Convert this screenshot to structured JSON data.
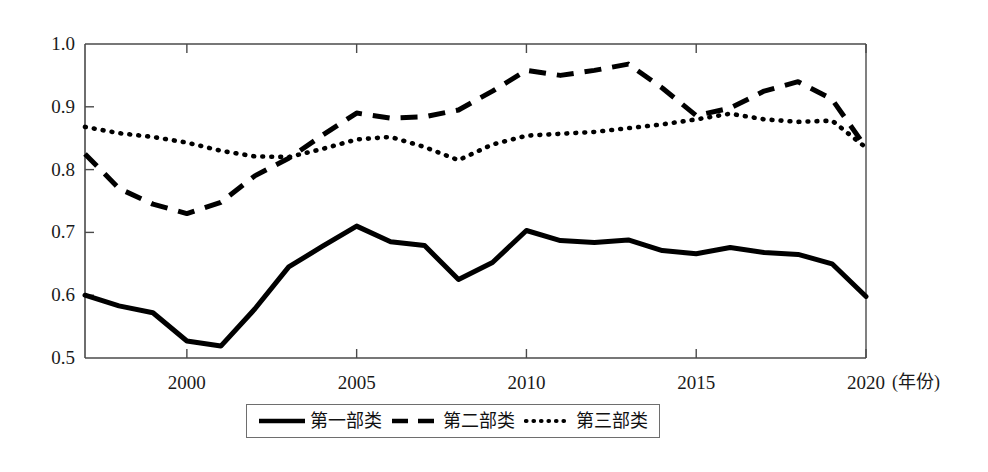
{
  "chart_data": {
    "type": "line",
    "title": "",
    "subtitle": "",
    "xlabel": "(年份)",
    "ylabel": "",
    "xlim": [
      1997,
      2020
    ],
    "ylim": [
      0.5,
      1.0
    ],
    "grid": false,
    "legend_position": "bottom",
    "x": [
      1997,
      1998,
      1999,
      2000,
      2001,
      2002,
      2003,
      2004,
      2005,
      2006,
      2007,
      2008,
      2009,
      2010,
      2011,
      2012,
      2013,
      2014,
      2015,
      2016,
      2017,
      2018,
      2019,
      2020
    ],
    "xticks": [
      2000,
      2005,
      2010,
      2015,
      2020
    ],
    "xtick_labels": [
      "2000",
      "2005",
      "2010",
      "2015",
      "2020"
    ],
    "yticks": [
      0.5,
      0.6,
      0.7,
      0.8,
      0.9,
      1.0
    ],
    "ytick_labels": [
      "0.5",
      "0.6",
      "0.7",
      "0.8",
      "0.9",
      "1.0"
    ],
    "series": [
      {
        "name": "第一部类",
        "style": "solid",
        "color": "#000000",
        "values": [
          0.6,
          0.583,
          0.572,
          0.527,
          0.519,
          0.578,
          0.645,
          0.678,
          0.71,
          0.685,
          0.679,
          0.625,
          0.652,
          0.703,
          0.687,
          0.684,
          0.688,
          0.671,
          0.666,
          0.676,
          0.668,
          0.665,
          0.65,
          0.598
        ]
      },
      {
        "name": "第二部类",
        "style": "dashed",
        "color": "#000000",
        "values": [
          0.825,
          0.77,
          0.745,
          0.73,
          0.748,
          0.79,
          0.818,
          0.855,
          0.89,
          0.882,
          0.884,
          0.895,
          0.925,
          0.958,
          0.95,
          0.958,
          0.968,
          0.93,
          0.886,
          0.898,
          0.925,
          0.94,
          0.912,
          0.835
        ]
      },
      {
        "name": "第三部类",
        "style": "dotted",
        "color": "#000000",
        "values": [
          0.868,
          0.858,
          0.852,
          0.843,
          0.83,
          0.821,
          0.82,
          0.833,
          0.848,
          0.852,
          0.836,
          0.815,
          0.84,
          0.854,
          0.857,
          0.86,
          0.866,
          0.872,
          0.88,
          0.889,
          0.88,
          0.876,
          0.878,
          0.835
        ]
      }
    ]
  },
  "legend": {
    "items": [
      {
        "label": "第一部类",
        "style": "solid"
      },
      {
        "label": "第二部类",
        "style": "dashed"
      },
      {
        "label": "第三部类",
        "style": "dotted"
      }
    ]
  },
  "axes": {
    "x_title": "(年份)",
    "frame_color": "#4a4a4a"
  }
}
